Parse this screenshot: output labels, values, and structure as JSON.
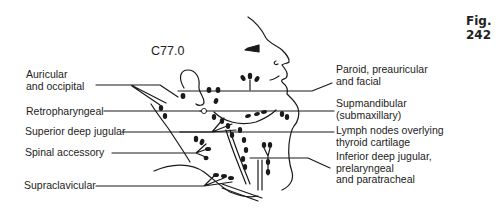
{
  "figure": {
    "number_label": "Fig. 242",
    "code_label": "C77.0"
  },
  "labels_left": [
    {
      "id": "auricular-occipital",
      "lines": [
        "Auricular",
        "and occipital"
      ]
    },
    {
      "id": "retropharyngeal",
      "lines": [
        "Retropharyngeal"
      ]
    },
    {
      "id": "superior-deep-jugular",
      "lines": [
        "Superior deep jugular"
      ]
    },
    {
      "id": "spinal-accessory",
      "lines": [
        "Spinal accessory"
      ]
    },
    {
      "id": "supraclavicular",
      "lines": [
        "Supraclavicular"
      ]
    }
  ],
  "labels_right": [
    {
      "id": "paroid-preauricular-facial",
      "lines": [
        "Paroid, preauricular",
        "and facial"
      ]
    },
    {
      "id": "supmandibular",
      "lines": [
        "Supmandibular",
        "(submaxillary)"
      ]
    },
    {
      "id": "lymph-nodes-thyroid",
      "lines": [
        "Lymph nodes overlying",
        "thyroid cartilage"
      ]
    },
    {
      "id": "inferior-deep-jugular",
      "lines": [
        "Inferior deep jugular,",
        "prelaryngeal",
        "and paratracheal"
      ]
    }
  ],
  "colors": {
    "ink": "#1a1a1a",
    "background": "#ffffff"
  }
}
